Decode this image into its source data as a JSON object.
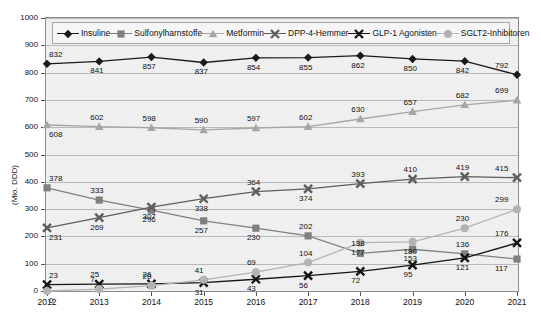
{
  "chart_data": {
    "type": "line",
    "title": "",
    "xlabel": "",
    "ylabel": "(Mio. DDD)",
    "categories": [
      "2012",
      "2013",
      "2014",
      "2015",
      "2016",
      "2017",
      "2018",
      "2019",
      "2020",
      "2021"
    ],
    "ylim": [
      0,
      1000
    ],
    "yticks": [
      "0",
      "100",
      "200",
      "300",
      "400",
      "500",
      "600",
      "700",
      "800",
      "900",
      "1000"
    ],
    "grid": true,
    "legend_position": "top-inside",
    "series": [
      {
        "name": "Insuline",
        "marker": "diamond",
        "color": "#1a1a1a",
        "values": [
          832,
          841,
          857,
          837,
          854,
          855,
          862,
          850,
          842,
          792
        ]
      },
      {
        "name": "Sulfonylharnstoffe",
        "marker": "square",
        "color": "#808080",
        "values": [
          378,
          333,
          296,
          257,
          230,
          202,
          138,
          153,
          136,
          117
        ]
      },
      {
        "name": "Metformin",
        "marker": "triangle",
        "color": "#a6a6a6",
        "values": [
          608,
          602,
          598,
          590,
          597,
          602,
          630,
          657,
          682,
          699
        ]
      },
      {
        "name": "DPP-4-Hemmer",
        "marker": "cross-gray",
        "color": "#5e5e5e",
        "values": [
          231,
          269,
          307,
          338,
          364,
          374,
          393,
          410,
          419,
          415
        ]
      },
      {
        "name": "GLP-1 Agonisten",
        "marker": "cross-black",
        "color": "#141414",
        "values": [
          23,
          25,
          26,
          31,
          43,
          56,
          72,
          95,
          121,
          176
        ]
      },
      {
        "name": "SGLT2-Inhibitoren",
        "marker": "circle",
        "color": "#b3b3b3",
        "values": [
          0,
          7,
          20,
          41,
          69,
          104,
          177,
          180,
          230,
          299
        ]
      }
    ]
  }
}
